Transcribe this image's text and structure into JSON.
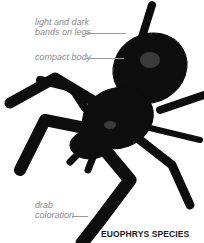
{
  "figure": {
    "caption": "EUOPHRYS SPECIES",
    "annotations": [
      {
        "text_line1": "light and dark",
        "text_line2": "bands on legs"
      },
      {
        "text_line1": "compact body"
      },
      {
        "text_line1": "drab",
        "text_line2": "coloration"
      }
    ]
  }
}
